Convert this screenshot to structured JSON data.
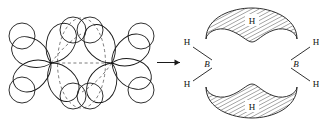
{
  "figure": {
    "name": "diborane-orbital-overlap-diagram",
    "colors": {
      "stroke": "#1a1a1a",
      "hatch": "#2a2a2a",
      "background": "#ffffff",
      "dashed": "#4a4a4a"
    }
  },
  "left_panel": {
    "name": "orbital-overlap-panel",
    "orbital_count": 8,
    "hydrogen_circle_count": 8,
    "boron_center_count": 2,
    "boron_centers": [
      {
        "id": "B-left",
        "x": 51,
        "y": 63
      },
      {
        "id": "B-right",
        "x": 112,
        "y": 63
      }
    ],
    "bridge_region_label": "",
    "dashed_outline": "three-center-two-electron bridge envelope"
  },
  "arrow": {
    "name": "reaction-arrow",
    "glyph": "→",
    "direction": "right"
  },
  "right_panel": {
    "name": "diborane-structure-panel",
    "boron_atoms": [
      {
        "label": "B",
        "position": "left"
      },
      {
        "label": "B",
        "position": "right"
      }
    ],
    "terminal_hydrogens": [
      {
        "label": "H",
        "position": "upper-left"
      },
      {
        "label": "H",
        "position": "lower-left"
      },
      {
        "label": "H",
        "position": "upper-right"
      },
      {
        "label": "H",
        "position": "lower-right"
      }
    ],
    "bridging_hydrogens": [
      {
        "label": "H",
        "position": "top-bridge",
        "orbital": "banana-crescent"
      },
      {
        "label": "H",
        "position": "bottom-bridge",
        "orbital": "banana-crescent"
      }
    ]
  }
}
